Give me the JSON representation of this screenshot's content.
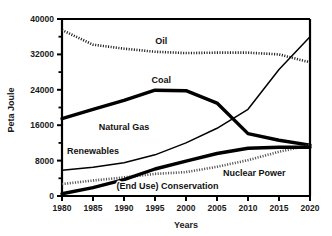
{
  "chart_data": {
    "type": "line",
    "title": "",
    "xlabel": "Years",
    "ylabel": "Peta Joule",
    "xlim": [
      1980,
      2020
    ],
    "ylim": [
      0,
      40000
    ],
    "grid": false,
    "legend_position": "inline-labels",
    "x_ticks": [
      1980,
      1985,
      1990,
      1995,
      2000,
      2005,
      2010,
      2015,
      2020
    ],
    "x_tick_labels": [
      "1980",
      "1985",
      "1990",
      "1995",
      "2000",
      "2005",
      "2010",
      "2015",
      "2020"
    ],
    "y_ticks": [
      0,
      8000,
      16000,
      24000,
      32000,
      40000
    ],
    "y_tick_labels": [
      "0",
      "8000",
      "16000",
      "24000",
      "32000",
      "40000"
    ],
    "y_minor_ticks": [
      4000,
      12000,
      20000,
      28000,
      36000
    ],
    "x": [
      1980,
      1985,
      1990,
      1995,
      2000,
      2005,
      2010,
      2015,
      2020
    ],
    "series": [
      {
        "name": "Oil",
        "style": "dotted",
        "color": "#222222",
        "values": [
          37500,
          34200,
          33300,
          32600,
          32300,
          32400,
          32400,
          32000,
          30200
        ]
      },
      {
        "name": "Coal",
        "style": "thick-solid",
        "color": "#000000",
        "values": [
          17500,
          19600,
          21600,
          23900,
          23800,
          21000,
          14100,
          12600,
          11500
        ]
      },
      {
        "name": "Natural Gas",
        "style": "thin-solid",
        "color": "#000000",
        "values": [
          5800,
          6500,
          7500,
          9300,
          12000,
          15300,
          19600,
          28600,
          36000
        ]
      },
      {
        "name": "Nuclear Power",
        "style": "dotted",
        "color": "#555555",
        "values": [
          2700,
          3500,
          4200,
          5000,
          5400,
          6600,
          8100,
          10000,
          11500
        ]
      },
      {
        "name": "(End Use) Conservation",
        "style": "thick-solid",
        "color": "#000000",
        "values": [
          500,
          1900,
          3700,
          6100,
          7900,
          9600,
          10800,
          11000,
          11000
        ]
      }
    ],
    "annotations": [
      {
        "text": "Oil",
        "x": 1996,
        "y": 34400
      },
      {
        "text": "Coal",
        "x": 1996,
        "y": 25600
      },
      {
        "text": "Natural Gas",
        "x": 1990,
        "y": 15000
      },
      {
        "text": "Renewables",
        "x": 1985,
        "y": 9600
      },
      {
        "text": "Nuclear Power",
        "x": 2011,
        "y": 4600
      },
      {
        "text": "(End Use) Conservation",
        "x": 1997,
        "y": 1600
      }
    ]
  },
  "axis": {
    "x_title": "Years",
    "y_title": "Peta Joule"
  }
}
